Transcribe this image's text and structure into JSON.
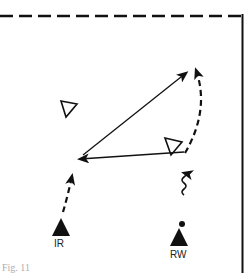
{
  "players": [
    {
      "id": "IR",
      "label": "IR"
    },
    {
      "id": "RW",
      "label": "RW"
    }
  ],
  "caption": "Fig. 11"
}
